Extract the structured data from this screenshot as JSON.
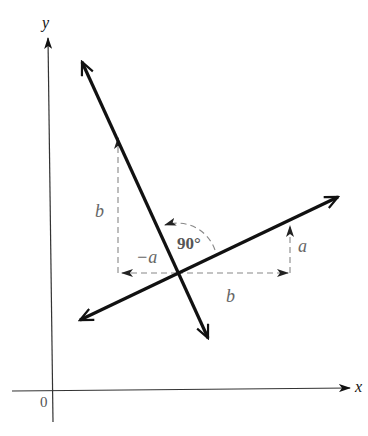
{
  "diagram": {
    "type": "perpendicular-lines-slope",
    "axes": {
      "x_label": "x",
      "y_label": "y",
      "origin_label": "0"
    },
    "labels": {
      "left_vertical": "b",
      "left_horizontal": "−a",
      "angle": "90°",
      "right_horizontal": "b",
      "right_vertical": "a"
    },
    "colors": {
      "line": "#111111",
      "dashed": "#888888",
      "label_gray": "#666666"
    }
  }
}
